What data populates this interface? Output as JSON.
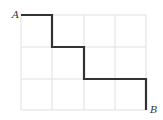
{
  "diagram": {
    "type": "grid-path",
    "grid": {
      "columns": 4,
      "rows": 3,
      "line_color": "#e0e0e0"
    },
    "path": {
      "color": "#333333",
      "steps": [
        "right",
        "down",
        "right",
        "down",
        "right",
        "right",
        "down"
      ]
    },
    "labels": {
      "start": "A",
      "end": "B"
    }
  }
}
